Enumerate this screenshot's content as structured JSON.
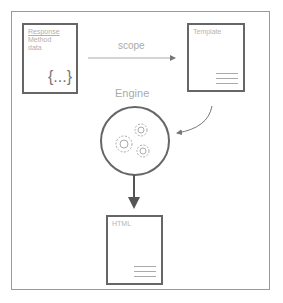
{
  "diagram": {
    "response_box": {
      "lines": [
        "Response",
        "Method",
        "data"
      ],
      "placeholder": "{...}"
    },
    "scope_label": "scope",
    "template_box": {
      "title": "Template"
    },
    "engine": {
      "label": "Engine",
      "icon": "gears-icon"
    },
    "html_box": {
      "title": "HTML"
    },
    "colors": {
      "stroke": "#666666",
      "text": "#aaaaaa",
      "frame": "#9a9a9a"
    }
  }
}
